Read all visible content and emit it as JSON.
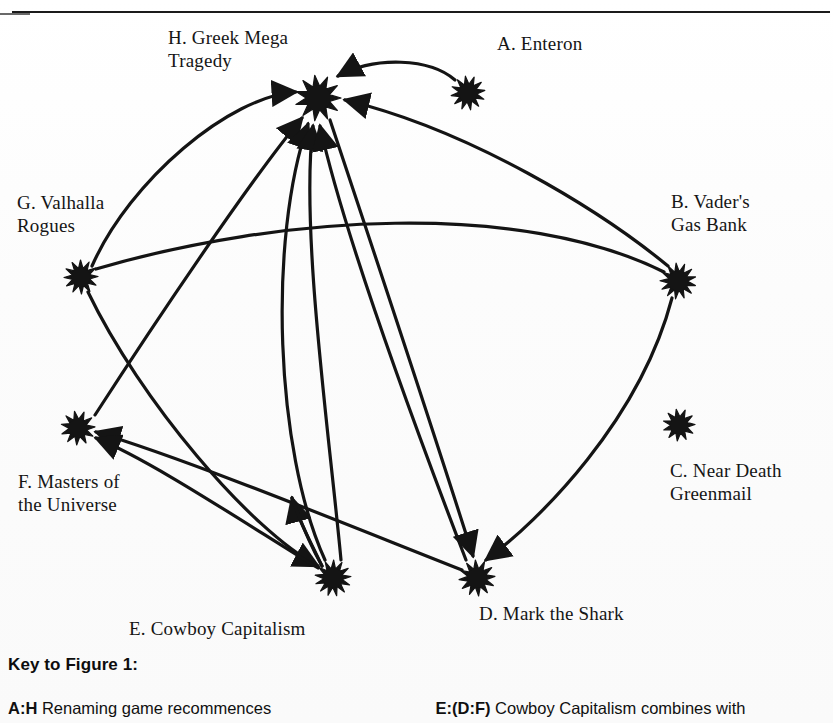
{
  "figure": {
    "node_style": "starburst",
    "ink_color": "#141414",
    "paper_color": "#fdfdfd"
  },
  "nodes": [
    {
      "id": "H",
      "code": "H.",
      "label": "H. Greek Mega\nTragedy",
      "label_line1": "H. Greek Mega",
      "label_line2": "Tragedy",
      "name": "Greek Mega Tragedy",
      "x": 318,
      "y": 98,
      "radius": 23,
      "label_x": 168,
      "label_y": 26,
      "label_align": "left"
    },
    {
      "id": "A",
      "code": "A.",
      "label": "A. Enteron",
      "label_line1": "A. Enteron",
      "label_line2": "",
      "name": "Enteron",
      "x": 468,
      "y": 93,
      "radius": 17,
      "label_x": 497,
      "label_y": 32,
      "label_align": "left"
    },
    {
      "id": "B",
      "code": "B.",
      "label": "B. Vader's\nGas Bank",
      "label_line1": "B. Vader's",
      "label_line2": "Gas Bank",
      "name": "Vader's Gas Bank",
      "x": 678,
      "y": 281,
      "radius": 18,
      "label_x": 671,
      "label_y": 190,
      "label_align": "left"
    },
    {
      "id": "C",
      "code": "C.",
      "label": "C. Near Death\nGreenmail",
      "label_line1": "C. Near Death",
      "label_line2": "Greenmail",
      "name": "Near Death Greenmail",
      "x": 679,
      "y": 425,
      "radius": 16,
      "label_x": 670,
      "label_y": 459,
      "label_align": "left"
    },
    {
      "id": "D",
      "code": "D.",
      "label": "D. Mark the Shark",
      "label_line1": "D. Mark the Shark",
      "label_line2": "",
      "name": "Mark the Shark",
      "x": 477,
      "y": 578,
      "radius": 18,
      "label_x": 479,
      "label_y": 602,
      "label_align": "left"
    },
    {
      "id": "E",
      "code": "E.",
      "label": "E. Cowboy Capitalism",
      "label_line1": "E. Cowboy Capitalism",
      "label_line2": "",
      "name": "Cowboy Capitalism",
      "x": 333,
      "y": 578,
      "radius": 18,
      "label_x": 129,
      "label_y": 617,
      "label_align": "left"
    },
    {
      "id": "F",
      "code": "F.",
      "label": "F. Masters of\nthe Universe",
      "label_line1": "F. Masters of",
      "label_line2": "the Universe",
      "name": "Masters of the Universe",
      "x": 78,
      "y": 428,
      "radius": 17,
      "label_x": 18,
      "label_y": 470,
      "label_align": "left"
    },
    {
      "id": "G",
      "code": "G.",
      "label": "G. Valhalla\nRogues",
      "label_line1": "G. Valhalla",
      "label_line2": "Rogues",
      "name": "Valhalla Rogues",
      "x": 81,
      "y": 277,
      "radius": 17,
      "label_x": 17,
      "label_y": 191,
      "label_align": "left"
    }
  ],
  "edges": [
    {
      "from": "A",
      "to": "H",
      "arrow": "to",
      "note": "A to H curved over the top"
    },
    {
      "from": "B",
      "to": "H",
      "arrow": "to",
      "note": "B to H long sweeping curve"
    },
    {
      "from": "G",
      "to": "H",
      "arrow": "to",
      "note": "G to H left curve"
    },
    {
      "from": "F",
      "to": "H",
      "arrow": "to",
      "note": "F to H rising curve"
    },
    {
      "from": "E",
      "to": "H",
      "arrow": "to",
      "note": "E to H rising curve"
    },
    {
      "from": "D",
      "to": "H",
      "arrow": "to",
      "note": "D to H rising curve"
    },
    {
      "from": "H",
      "to": "D",
      "arrow": "to",
      "note": "H down to D"
    },
    {
      "from": "G",
      "to": "B",
      "arrow": "none",
      "note": "G to B long shallow arc"
    },
    {
      "from": "G",
      "to": "E",
      "arrow": "to",
      "note": "G down to E"
    },
    {
      "from": "B",
      "to": "D",
      "arrow": "to",
      "note": "B curving down to D"
    },
    {
      "from": "E",
      "to": "F",
      "arrow": "to",
      "note": "E up-left to F"
    },
    {
      "from": "D",
      "to": "F",
      "arrow": "to",
      "note": "D to F long line"
    },
    {
      "from": "E",
      "to": "bend",
      "arrow": "to",
      "note": "short arrow from E up to a bend point"
    }
  ],
  "key": {
    "title": "Key to Figure 1:",
    "entries_left": [
      {
        "code": "A:H",
        "text": "Renaming game recommences"
      }
    ],
    "entries_right": [
      {
        "code": "E:(D:F)",
        "text": "Cowboy Capitalism combines with"
      }
    ]
  }
}
